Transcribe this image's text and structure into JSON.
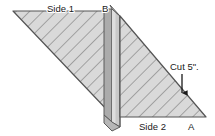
{
  "diagram": {
    "background_color": "#ffffff",
    "panel_fill_color": "#d9d9d9",
    "panel_hatch_color": "#8c8c8c",
    "panel_outline_color": "#4d4d4d",
    "spine_dark_color": "#a8a8a8",
    "spine_mid_color": "#c4c4c4",
    "spine_light_color": "#d6d6d6",
    "arrow_color": "#1a1a1a",
    "labels": {
      "side1": "Side 1",
      "side2": "Side 2",
      "vertex_b": "B",
      "vertex_a": "A",
      "cut": "Cut 5\"."
    }
  }
}
